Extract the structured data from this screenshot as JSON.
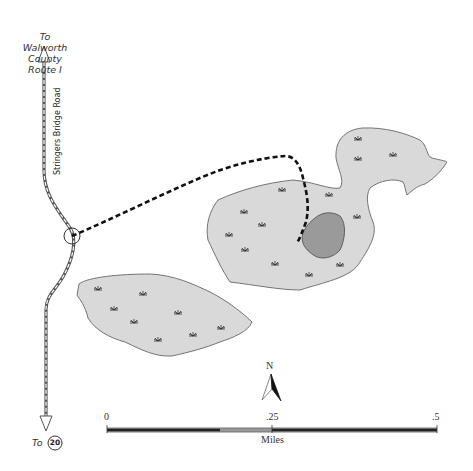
{
  "map": {
    "labels": {
      "north_destination": [
        "To",
        "Walworth County",
        "Route I"
      ],
      "south_destination_prefix": "To",
      "south_route_shield": "20",
      "road_name": "Stringers Bridge Road"
    },
    "compass": {
      "label": "N"
    },
    "scale_bar": {
      "ticks": [
        "0",
        ".25",
        ".5"
      ],
      "unit": "Miles"
    },
    "features": [
      {
        "name": "upper-marsh",
        "type": "wetland",
        "fill": "#d9d9d9",
        "marsh_symbols": 15
      },
      {
        "name": "lower-marsh",
        "type": "wetland",
        "fill": "#d9d9d9",
        "marsh_symbols": 8
      },
      {
        "name": "pond",
        "type": "water",
        "fill": "#999999"
      },
      {
        "name": "trail",
        "type": "dashed-path",
        "color": "#111111"
      },
      {
        "name": "trailhead",
        "type": "circle-marker"
      },
      {
        "name": "stringers-bridge-road",
        "type": "road"
      }
    ],
    "colors": {
      "marsh_fill": "#d9d9d9",
      "marsh_stroke": "#666666",
      "pond_fill": "#9a9a9a",
      "trail": "#111111",
      "road": "#555555"
    }
  }
}
